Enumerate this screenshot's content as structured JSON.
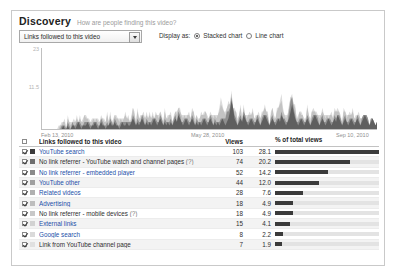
{
  "header": {
    "title": "Discovery",
    "subtitle": "How are people finding this video?"
  },
  "controls": {
    "dimension_select_value": "Links followed to this video",
    "display_as_label": "Display as:",
    "options": [
      {
        "label": "Stacked chart",
        "selected": true
      },
      {
        "label": "Line chart",
        "selected": false
      }
    ]
  },
  "chart_data": {
    "type": "area",
    "stacked": true,
    "title": "",
    "xlabel": "",
    "ylabel": "",
    "ylim": [
      0,
      23
    ],
    "yticks": [
      "23",
      "11.5"
    ],
    "xticks": [
      "Feb 13, 2010",
      "May 28, 2010",
      "Sep 10, 2010"
    ],
    "grid": false,
    "legend": "none",
    "series": [
      {
        "name": "YouTube search",
        "color": "#5f5f5f",
        "values": [
          0,
          0,
          0,
          0,
          0,
          0,
          0,
          0,
          0,
          0,
          0,
          0,
          0,
          0,
          1,
          0,
          0,
          1,
          0,
          0,
          1,
          1,
          0,
          1,
          2,
          1,
          0,
          1,
          1,
          1,
          2,
          1,
          0,
          1,
          1,
          2,
          1,
          0,
          1,
          2,
          1,
          1,
          0,
          1,
          1,
          2,
          1,
          1,
          2,
          1,
          1,
          0,
          1,
          2,
          1,
          1,
          2,
          1,
          1,
          2,
          3,
          2,
          1,
          2,
          1,
          2,
          3,
          2,
          1,
          2,
          1,
          2,
          1,
          2,
          3,
          2,
          1,
          2,
          3,
          2,
          1,
          2,
          1,
          2,
          1,
          2,
          1,
          2,
          3,
          2,
          4,
          3,
          2,
          1,
          2,
          3,
          2,
          1,
          2,
          3,
          2,
          1,
          2,
          1,
          2,
          1,
          2,
          3,
          2,
          1,
          2,
          3,
          2,
          1,
          2,
          1,
          2,
          1,
          2,
          3,
          2,
          1,
          2,
          3,
          5,
          8,
          6,
          3,
          2,
          1,
          2,
          3,
          2,
          4,
          3,
          2,
          1,
          2,
          3,
          2,
          1,
          2,
          3,
          2,
          1,
          2,
          3,
          4,
          3,
          2,
          1,
          2,
          3,
          2,
          1,
          2,
          3,
          2,
          4,
          3,
          2,
          1,
          2,
          3,
          5,
          7,
          5,
          3,
          2,
          1,
          2,
          3,
          2,
          1,
          2,
          3,
          2,
          1,
          2,
          3,
          4,
          3,
          2,
          1,
          2,
          3,
          2,
          1,
          2,
          3,
          2,
          1,
          2,
          3,
          2,
          4,
          3,
          2,
          1,
          2,
          3,
          2,
          1,
          2,
          3,
          2,
          1,
          2,
          3,
          2,
          1,
          2,
          3,
          4,
          3,
          2,
          1,
          2,
          3,
          2,
          1,
          2
        ]
      },
      {
        "name": "No link referrer - YouTube watch and channel pages",
        "color": "#8f8f8f",
        "values": [
          0,
          0,
          0,
          0,
          0,
          0,
          0,
          0,
          0,
          0,
          0,
          0,
          0,
          1,
          0,
          1,
          0,
          1,
          1,
          0,
          1,
          0,
          1,
          1,
          0,
          1,
          1,
          0,
          1,
          1,
          0,
          1,
          1,
          0,
          1,
          0,
          1,
          1,
          0,
          1,
          1,
          0,
          1,
          1,
          0,
          1,
          1,
          0,
          1,
          1,
          0,
          1,
          1,
          0,
          1,
          1,
          0,
          1,
          1,
          0,
          1,
          1,
          0,
          1,
          1,
          0,
          1,
          1,
          0,
          1,
          1,
          0,
          1,
          1,
          0,
          1,
          1,
          0,
          1,
          1,
          0,
          1,
          1,
          0,
          1,
          1,
          0,
          1,
          1,
          0,
          1,
          1,
          0,
          1,
          1,
          0,
          1,
          1,
          0,
          1,
          1,
          0,
          1,
          1,
          0,
          1,
          1,
          0,
          1,
          1,
          0,
          1,
          1,
          0,
          1,
          1,
          0,
          1,
          1,
          0,
          1,
          2,
          3,
          2,
          1,
          1,
          0,
          1,
          1,
          0,
          1,
          1,
          0,
          1,
          1,
          0,
          1,
          1,
          0,
          1,
          1,
          0,
          1,
          1,
          0,
          1,
          1,
          0,
          1,
          1,
          0,
          1,
          1,
          0,
          1,
          1,
          0,
          1,
          1,
          0,
          1,
          1,
          0,
          2,
          3,
          2,
          1,
          1,
          0,
          1,
          1,
          0,
          1,
          1,
          0,
          1,
          1,
          0,
          1,
          1,
          0,
          1,
          1,
          0,
          1,
          1,
          0,
          1,
          1,
          0,
          1,
          1,
          0,
          1,
          1,
          0,
          1,
          1,
          0,
          1,
          1,
          0,
          1,
          1,
          0,
          1,
          1,
          0,
          1,
          1,
          0,
          1,
          1,
          0,
          1,
          1,
          0,
          1
        ]
      },
      {
        "name": "No link referrer - embedded player",
        "color": "#c3c3c3",
        "values": [
          0,
          0,
          0,
          0,
          0,
          0,
          0,
          0,
          0,
          0,
          0,
          0,
          1,
          0,
          1,
          1,
          0,
          1,
          1,
          1,
          0,
          1,
          1,
          1,
          0,
          1,
          1,
          1,
          2,
          1,
          1,
          0,
          1,
          1,
          1,
          0,
          1,
          1,
          1,
          0,
          1,
          1,
          1,
          2,
          1,
          1,
          0,
          1,
          1,
          1,
          2,
          1,
          1,
          0,
          1,
          2,
          1,
          1,
          0,
          1,
          2,
          1,
          1,
          2,
          1,
          1,
          0,
          1,
          2,
          1,
          1,
          2,
          1,
          1,
          0,
          1,
          2,
          1,
          1,
          0,
          1,
          2,
          1,
          1,
          2,
          1,
          1,
          0,
          1,
          2,
          1,
          1,
          2,
          1,
          1,
          0,
          1,
          2,
          1,
          1,
          2,
          1,
          1,
          0,
          1,
          2,
          1,
          1,
          2,
          1,
          1,
          0,
          1,
          2,
          1,
          1,
          2,
          3,
          4,
          3,
          2,
          1,
          1,
          2,
          1,
          1,
          0,
          1,
          2,
          1,
          1,
          2,
          1,
          1,
          0,
          1,
          2,
          1,
          1,
          2,
          1,
          1,
          0,
          1,
          2,
          1,
          1,
          2,
          1,
          1,
          0,
          1,
          2,
          1,
          1,
          2,
          3,
          4,
          3,
          2,
          1,
          1,
          2,
          1,
          1,
          0,
          1,
          2,
          1,
          1,
          2,
          1,
          1,
          0,
          1,
          2,
          1,
          1,
          2,
          1,
          1,
          0,
          1,
          2,
          1,
          1,
          2,
          1,
          1,
          0,
          1,
          2,
          1,
          1,
          2,
          1,
          1,
          0,
          1,
          2,
          1,
          1,
          2,
          1,
          1,
          2,
          1,
          1,
          0,
          1,
          2
        ]
      },
      {
        "name": "YouTube other",
        "color": "#dcdcdc",
        "values": [
          0,
          0,
          0,
          0,
          0,
          0,
          0,
          0,
          0,
          0,
          0,
          1,
          0,
          1,
          0,
          1,
          0,
          1,
          0,
          1,
          0,
          1,
          0,
          1,
          0,
          1,
          0,
          1,
          0,
          1,
          0,
          1,
          0,
          1,
          0,
          1,
          0,
          1,
          0,
          1,
          0,
          1,
          0,
          1,
          0,
          1,
          0,
          1,
          0,
          1,
          0,
          1,
          0,
          1,
          0,
          1,
          0,
          1,
          0,
          1,
          0,
          1,
          0,
          1,
          0,
          1,
          0,
          1,
          0,
          1,
          0,
          1,
          0,
          1,
          0,
          1,
          0,
          1,
          0,
          1,
          0,
          1,
          0,
          1,
          0,
          1,
          0,
          1,
          0,
          1,
          0,
          1,
          0,
          1,
          0,
          1,
          0,
          1,
          0,
          1,
          0,
          1,
          0,
          1,
          0,
          1,
          0,
          1,
          0,
          1,
          0,
          1,
          0,
          1,
          0,
          1,
          0,
          1,
          2,
          1,
          0,
          1,
          0,
          1,
          0,
          1,
          0,
          1,
          0,
          1,
          0,
          1,
          0,
          1,
          0,
          1,
          0,
          1,
          0,
          1,
          0,
          1,
          0,
          1,
          0,
          1,
          0,
          1,
          0,
          1,
          0,
          1,
          0,
          1,
          0,
          1,
          0,
          1,
          2,
          1,
          0,
          1,
          0,
          1,
          0,
          1,
          0,
          1,
          0,
          1,
          0,
          1,
          0,
          1,
          0,
          1,
          0,
          1,
          0,
          1,
          0,
          1,
          0,
          1,
          0,
          1,
          0,
          1,
          0,
          1,
          0,
          1,
          0,
          1,
          0,
          1,
          0,
          1,
          0,
          1,
          0,
          1,
          0,
          1,
          0,
          1,
          0,
          1,
          0,
          1
        ]
      }
    ]
  },
  "table": {
    "columns": {
      "label": "Links followed to this video",
      "views": "Views",
      "pct": "% of total views"
    },
    "rows": [
      {
        "label": "YouTube search",
        "link": true,
        "views": "103",
        "pct": "28.1",
        "pct_value": 28.1,
        "color": "#3b3b3b",
        "checked": true,
        "note": ""
      },
      {
        "label": "No link referrer - YouTube watch and channel pages",
        "link": false,
        "views": "74",
        "pct": "20.2",
        "pct_value": 20.2,
        "color": "#6e6e6e",
        "checked": true,
        "note": "(?)"
      },
      {
        "label": "No link referrer - embedded player",
        "link": true,
        "views": "52",
        "pct": "14.2",
        "pct_value": 14.2,
        "color": "#8a8a8a",
        "checked": true,
        "note": ""
      },
      {
        "label": "YouTube other",
        "link": true,
        "views": "44",
        "pct": "12.0",
        "pct_value": 12.0,
        "color": "#9f9f9f",
        "checked": true,
        "note": ""
      },
      {
        "label": "Related videos",
        "link": true,
        "views": "28",
        "pct": "7.6",
        "pct_value": 7.6,
        "color": "#b0b0b0",
        "checked": true,
        "note": ""
      },
      {
        "label": "Advertising",
        "link": true,
        "views": "18",
        "pct": "4.9",
        "pct_value": 4.9,
        "color": "#bdbdbd",
        "checked": true,
        "note": ""
      },
      {
        "label": "No link referrer - mobile devices",
        "link": false,
        "views": "18",
        "pct": "4.9",
        "pct_value": 4.9,
        "color": "#c8c8c8",
        "checked": true,
        "note": "(?)"
      },
      {
        "label": "External links",
        "link": true,
        "views": "15",
        "pct": "4.1",
        "pct_value": 4.1,
        "color": "#d2d2d2",
        "checked": true,
        "note": ""
      },
      {
        "label": "Google search",
        "link": true,
        "views": "8",
        "pct": "2.2",
        "pct_value": 2.2,
        "color": "#dadada",
        "checked": true,
        "note": ""
      },
      {
        "label": "Link from YouTube channel page",
        "link": false,
        "views": "7",
        "pct": "1.9",
        "pct_value": 1.9,
        "color": "#e0e0e0",
        "checked": true,
        "note": ""
      }
    ]
  }
}
